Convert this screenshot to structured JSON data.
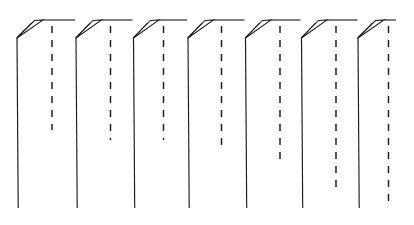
{
  "figure": {
    "type": "line-drawing",
    "title": "",
    "caption": "",
    "background_color": "#ffffff",
    "line_color": "#1a1a1a",
    "canvas": {
      "width": 414,
      "height": 225
    },
    "geometry": {
      "top_baseline_y": 20,
      "fold_shoulder_y": 38,
      "bottom_y": 208,
      "unit_count": 7,
      "unit_pitch": 53.2,
      "first_riser_x": 17,
      "solid_stroke_width": 1.15,
      "dash_stroke_width": 1.45,
      "dash_pattern": "7 7"
    },
    "units": [
      {
        "index": 1,
        "riser_x": 17.0,
        "peak_x": 43.0,
        "dash_x": 52.0,
        "dash_top_y": 26,
        "dash_bottom_y": 130,
        "riser_bottom_y": 208
      },
      {
        "index": 2,
        "riser_x": 76.0,
        "peak_x": 101.5,
        "dash_x": 110.5,
        "dash_top_y": 26,
        "dash_bottom_y": 140,
        "riser_bottom_y": 208
      },
      {
        "index": 3,
        "riser_x": 133.5,
        "peak_x": 159.0,
        "dash_x": 163.5,
        "dash_top_y": 26,
        "dash_bottom_y": 140,
        "riser_bottom_y": 208
      },
      {
        "index": 4,
        "riser_x": 188.0,
        "peak_x": 213.5,
        "dash_x": 221.5,
        "dash_top_y": 26,
        "dash_bottom_y": 152,
        "riser_bottom_y": 208
      },
      {
        "index": 5,
        "riser_x": 245.5,
        "peak_x": 271.0,
        "dash_x": 280.0,
        "dash_top_y": 26,
        "dash_bottom_y": 166,
        "riser_bottom_y": 208
      },
      {
        "index": 6,
        "riser_x": 301.5,
        "peak_x": 327.0,
        "dash_x": 336.0,
        "dash_top_y": 26,
        "dash_bottom_y": 190,
        "riser_bottom_y": 208
      },
      {
        "index": 7,
        "riser_x": 358.0,
        "peak_x": 384.0,
        "dash_x": 388.5,
        "dash_top_y": 26,
        "dash_bottom_y": 208,
        "riser_bottom_y": 208
      }
    ],
    "labels": [],
    "annotations": []
  }
}
